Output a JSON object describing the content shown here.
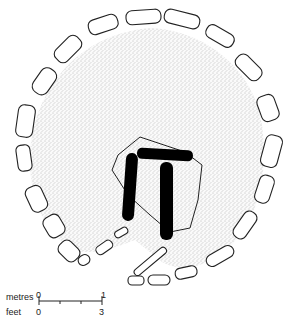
{
  "diagram": {
    "scale": {
      "metres_label": "metres",
      "feet_label": "feet",
      "metres_start": "0",
      "metres_end": "1",
      "feet_start": "0",
      "feet_end": "3"
    },
    "colors": {
      "stone_outline": "#222222",
      "fill_stipple": "#bdbdbd",
      "trilithon": "#000000"
    }
  }
}
